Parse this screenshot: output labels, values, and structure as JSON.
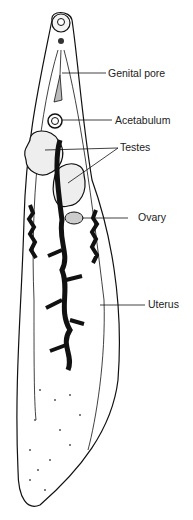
{
  "diagram": {
    "labels": [
      {
        "id": "genital-pore",
        "text": "Genital pore"
      },
      {
        "id": "acetabulum",
        "text": "Acetabulum"
      },
      {
        "id": "testes",
        "text": "Testes"
      },
      {
        "id": "ovary",
        "text": "Ovary"
      },
      {
        "id": "uterus",
        "text": "Uterus"
      }
    ],
    "colors": {
      "line": "#111111",
      "background": "#ffffff"
    }
  }
}
